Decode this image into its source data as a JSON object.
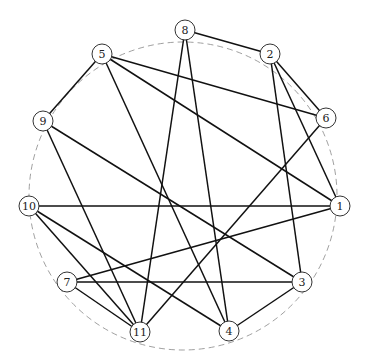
{
  "graph": {
    "nodes": [
      {
        "id": "1",
        "label": "1"
      },
      {
        "id": "2",
        "label": "2"
      },
      {
        "id": "3",
        "label": "3"
      },
      {
        "id": "4",
        "label": "4"
      },
      {
        "id": "5",
        "label": "5"
      },
      {
        "id": "6",
        "label": "6"
      },
      {
        "id": "7",
        "label": "7"
      },
      {
        "id": "8",
        "label": "8"
      },
      {
        "id": "9",
        "label": "9"
      },
      {
        "id": "10",
        "label": "10"
      },
      {
        "id": "11",
        "label": "11"
      }
    ],
    "edges": [
      [
        "8",
        "2"
      ],
      [
        "8",
        "11"
      ],
      [
        "8",
        "4"
      ],
      [
        "2",
        "6"
      ],
      [
        "2",
        "1"
      ],
      [
        "2",
        "3"
      ],
      [
        "5",
        "9"
      ],
      [
        "5",
        "6"
      ],
      [
        "5",
        "1"
      ],
      [
        "5",
        "4"
      ],
      [
        "9",
        "11"
      ],
      [
        "9",
        "3"
      ],
      [
        "6",
        "11"
      ],
      [
        "10",
        "1"
      ],
      [
        "10",
        "11"
      ],
      [
        "10",
        "4"
      ],
      [
        "7",
        "1"
      ],
      [
        "7",
        "3"
      ],
      [
        "7",
        "11"
      ],
      [
        "3",
        "4"
      ]
    ]
  }
}
